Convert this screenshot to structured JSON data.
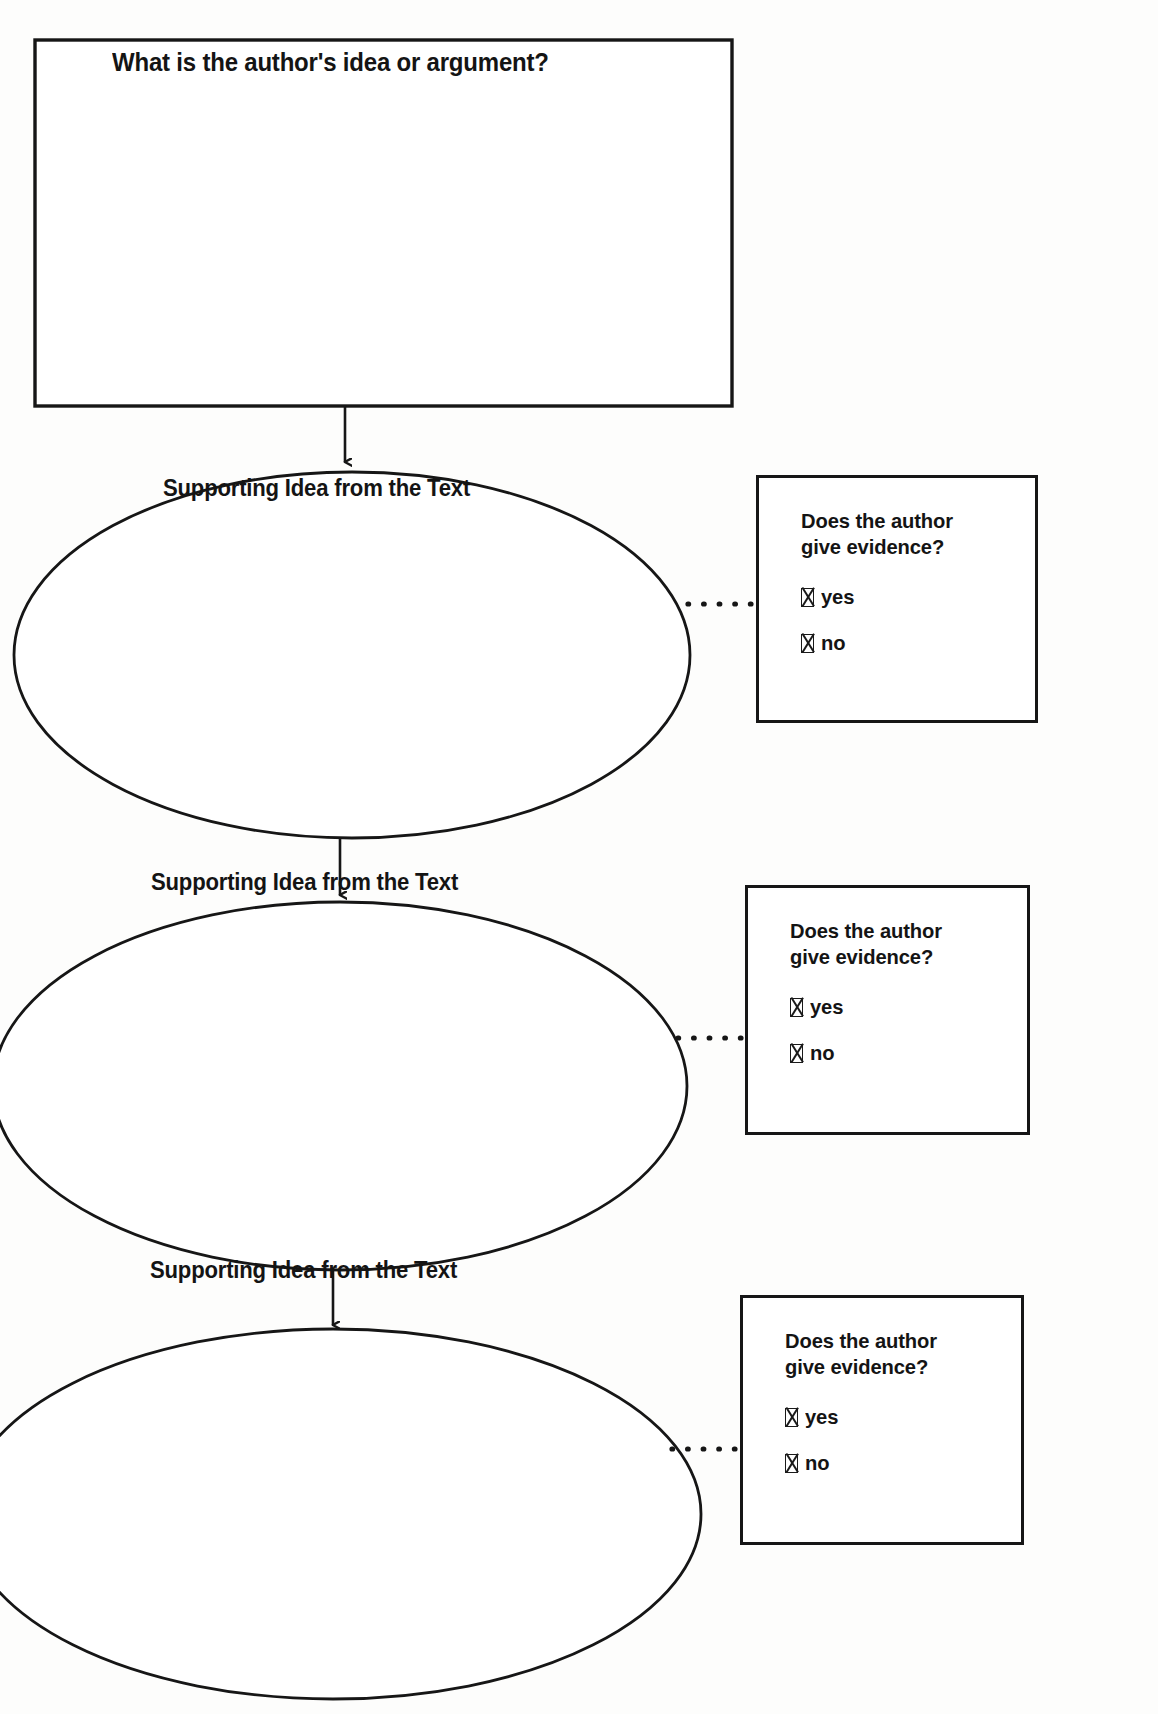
{
  "worksheet": {
    "main_box": {
      "question": "What is the author's idea or argument?",
      "answer_value": ""
    },
    "branches": [
      {
        "ellipse_label": "Supporting Idea from the Text",
        "ellipse_value": "",
        "evidence_box": {
          "question_line_1": "Does the author",
          "question_line_2": "give evidence?",
          "options": [
            {
              "checkbox": "checkbox-x-icon",
              "label": "yes",
              "checked": true
            },
            {
              "checkbox": "checkbox-x-icon",
              "label": "no",
              "checked": true
            }
          ]
        }
      },
      {
        "ellipse_label": "Supporting Idea from the Text",
        "ellipse_value": "",
        "evidence_box": {
          "question_line_1": "Does the author",
          "question_line_2": "give evidence?",
          "options": [
            {
              "checkbox": "checkbox-x-icon",
              "label": "yes",
              "checked": true
            },
            {
              "checkbox": "checkbox-x-icon",
              "label": "no",
              "checked": true
            }
          ]
        }
      },
      {
        "ellipse_label": "Supporting Idea from the Text",
        "ellipse_value": "",
        "evidence_box": {
          "question_line_1": "Does the author",
          "question_line_2": "give evidence?",
          "options": [
            {
              "checkbox": "checkbox-x-icon",
              "label": "yes",
              "checked": true
            },
            {
              "checkbox": "checkbox-x-icon",
              "label": "no",
              "checked": true
            }
          ]
        }
      }
    ],
    "colors": {
      "ink": "#161616",
      "paper": "#ffffff"
    }
  }
}
